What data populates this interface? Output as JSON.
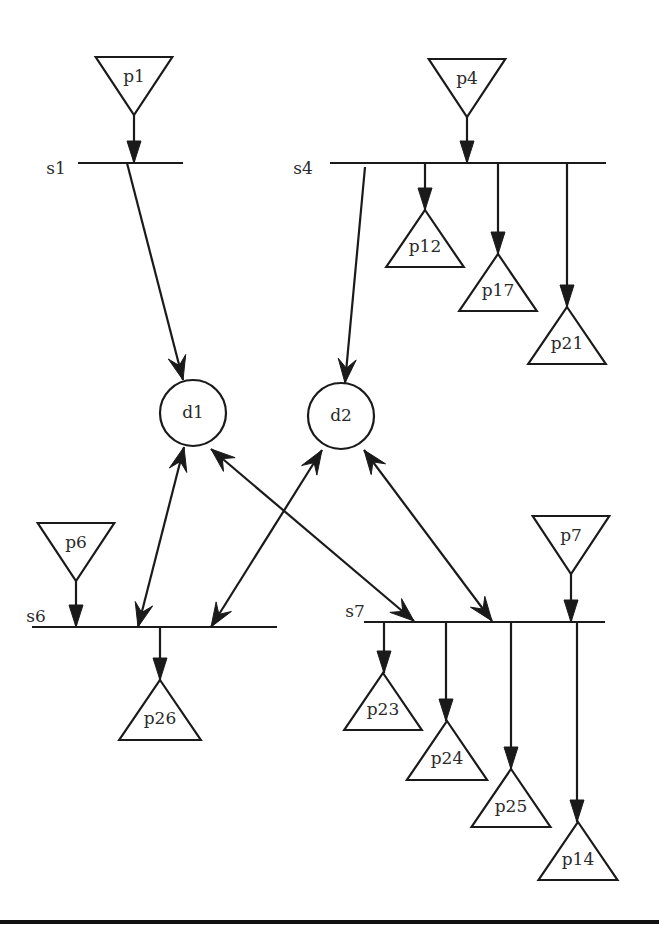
{
  "diagram": {
    "title": "",
    "stroke_color": "#1a1a1a",
    "background": "#ffffff",
    "sources": [
      {
        "id": "p1",
        "label": "p1",
        "cx": 134,
        "top": 57,
        "bottom": 115
      },
      {
        "id": "p4",
        "label": "p4",
        "cx": 467,
        "top": 59,
        "bottom": 117
      },
      {
        "id": "p6",
        "label": "p6",
        "cx": 76,
        "top": 523,
        "bottom": 581
      },
      {
        "id": "p7",
        "label": "p7",
        "cx": 571,
        "top": 516,
        "bottom": 574
      }
    ],
    "sinks": [
      {
        "id": "p12",
        "label": "p12",
        "cx": 425,
        "top": 210,
        "bottom": 267
      },
      {
        "id": "p17",
        "label": "p17",
        "cx": 498,
        "top": 254,
        "bottom": 311
      },
      {
        "id": "p21",
        "label": "p21",
        "cx": 567,
        "top": 307,
        "bottom": 364
      },
      {
        "id": "p26",
        "label": "p26",
        "cx": 160,
        "top": 680,
        "bottom": 740
      },
      {
        "id": "p23",
        "label": "p23",
        "cx": 383,
        "top": 673,
        "bottom": 730
      },
      {
        "id": "p24",
        "label": "p24",
        "cx": 447,
        "top": 721,
        "bottom": 780
      },
      {
        "id": "p25",
        "label": "p25",
        "cx": 511,
        "top": 769,
        "bottom": 827
      },
      {
        "id": "p14",
        "label": "p14",
        "cx": 578,
        "top": 822,
        "bottom": 880
      }
    ],
    "devices": [
      {
        "id": "d1",
        "label": "d1",
        "cx": 193,
        "cy": 413,
        "r": 33
      },
      {
        "id": "d2",
        "label": "d2",
        "cx": 341,
        "cy": 416,
        "r": 33
      }
    ],
    "switches": [
      {
        "id": "s1",
        "label": "s1",
        "label_x": 56,
        "label_y": 169,
        "x1": 78,
        "x2": 183,
        "y": 163
      },
      {
        "id": "s4",
        "label": "s4",
        "label_x": 303,
        "label_y": 169,
        "x1": 330,
        "x2": 606,
        "y": 163
      },
      {
        "id": "s6",
        "label": "s6",
        "label_x": 36,
        "label_y": 617,
        "x1": 32,
        "x2": 277,
        "y": 627
      },
      {
        "id": "s7",
        "label": "s7",
        "label_x": 355,
        "label_y": 612,
        "x1": 364,
        "x2": 605,
        "y": 622
      }
    ],
    "arrows": [
      {
        "from": "p1",
        "to": "s1",
        "x1": 134,
        "y1": 115,
        "x2": 134,
        "y2": 163,
        "style": "filled",
        "heads": "end"
      },
      {
        "from": "s1",
        "to": "d1",
        "x1": 127,
        "y1": 163,
        "x2": 183,
        "y2": 380,
        "style": "open",
        "heads": "end"
      },
      {
        "from": "p4",
        "to": "s4",
        "x1": 467,
        "y1": 117,
        "x2": 467,
        "y2": 163,
        "style": "filled",
        "heads": "end"
      },
      {
        "from": "s4",
        "to": "d2",
        "x1": 365,
        "y1": 167,
        "x2": 345,
        "y2": 383,
        "style": "open",
        "heads": "end"
      },
      {
        "from": "s4",
        "to": "p12",
        "x1": 425,
        "y1": 163,
        "x2": 425,
        "y2": 210,
        "style": "filled",
        "heads": "end"
      },
      {
        "from": "s4",
        "to": "p17",
        "x1": 498,
        "y1": 163,
        "x2": 498,
        "y2": 254,
        "style": "filled",
        "heads": "end"
      },
      {
        "from": "s4",
        "to": "p21",
        "x1": 567,
        "y1": 163,
        "x2": 567,
        "y2": 307,
        "style": "filled",
        "heads": "end"
      },
      {
        "from": "d1",
        "to": "s6",
        "x1": 184,
        "y1": 447,
        "x2": 138,
        "y2": 627,
        "style": "open",
        "heads": "both"
      },
      {
        "from": "d1",
        "to": "s7",
        "x1": 211,
        "y1": 449,
        "x2": 414,
        "y2": 621,
        "style": "open",
        "heads": "both"
      },
      {
        "from": "d2",
        "to": "s6",
        "x1": 322,
        "y1": 450,
        "x2": 211,
        "y2": 627,
        "style": "open",
        "heads": "both"
      },
      {
        "from": "d2",
        "to": "s7",
        "x1": 364,
        "y1": 450,
        "x2": 492,
        "y2": 621,
        "style": "open",
        "heads": "both"
      },
      {
        "from": "p6",
        "to": "s6",
        "x1": 76,
        "y1": 581,
        "x2": 76,
        "y2": 627,
        "style": "filled",
        "heads": "end"
      },
      {
        "from": "s6",
        "to": "p26",
        "x1": 160,
        "y1": 627,
        "x2": 160,
        "y2": 680,
        "style": "filled",
        "heads": "end"
      },
      {
        "from": "p7",
        "to": "s7",
        "x1": 571,
        "y1": 574,
        "x2": 571,
        "y2": 622,
        "style": "filled",
        "heads": "end"
      },
      {
        "from": "s7",
        "to": "p23",
        "x1": 384,
        "y1": 622,
        "x2": 384,
        "y2": 673,
        "style": "filled",
        "heads": "end"
      },
      {
        "from": "s7",
        "to": "p24",
        "x1": 446,
        "y1": 622,
        "x2": 446,
        "y2": 721,
        "style": "filled",
        "heads": "end"
      },
      {
        "from": "s7",
        "to": "p25",
        "x1": 511,
        "y1": 622,
        "x2": 511,
        "y2": 769,
        "style": "filled",
        "heads": "end"
      },
      {
        "from": "s7",
        "to": "p14",
        "x1": 577,
        "y1": 622,
        "x2": 577,
        "y2": 822,
        "style": "filled",
        "heads": "end"
      }
    ],
    "bottom_rule": {
      "y": 920,
      "thickness": 4
    }
  }
}
